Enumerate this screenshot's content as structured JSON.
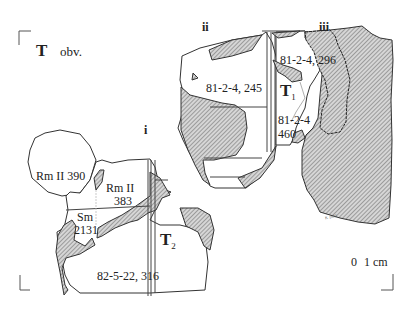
{
  "figure": {
    "heading": {
      "letter": "T",
      "side": "obv."
    },
    "group_labels": [
      {
        "id": "i",
        "text": "i"
      },
      {
        "id": "ii",
        "text": "ii"
      },
      {
        "id": "iii",
        "text": "iii"
      }
    ],
    "join_labels": [
      {
        "id": "T1",
        "main": "T",
        "sub": "1"
      },
      {
        "id": "T2",
        "main": "T",
        "sub": "2"
      }
    ],
    "fragments": [
      {
        "id": "f245",
        "text": "81-2-4, 245"
      },
      {
        "id": "f296",
        "text": "81-2-4, 296"
      },
      {
        "id": "f460a",
        "text": "81-2-4"
      },
      {
        "id": "f460b",
        "text": "460"
      },
      {
        "id": "frm390",
        "text": "Rm II 390"
      },
      {
        "id": "frm383a",
        "text": "Rm II"
      },
      {
        "id": "frm383b",
        "text": "383"
      },
      {
        "id": "fsm_a",
        "text": "Sm"
      },
      {
        "id": "fsm_b",
        "text": "2131"
      },
      {
        "id": "f316",
        "text": "82-5-22,  316"
      }
    ],
    "scale": {
      "zero": "0",
      "unit": "1 cm"
    },
    "signature": "K 1992",
    "colors": {
      "ink": "#333333",
      "hatch_fill": "#bdbdbd",
      "paper": "#ffffff"
    }
  }
}
